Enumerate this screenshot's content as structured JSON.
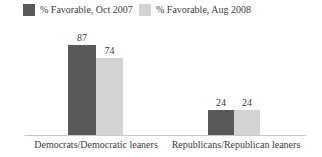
{
  "chart_data": {
    "type": "bar",
    "title": "",
    "categories": [
      "Democrats/Democratic leaners",
      "Republicans/Republican leaners"
    ],
    "series": [
      {
        "name": "% Favorable, Oct 2007",
        "color": "#58595b",
        "values": [
          87,
          24
        ]
      },
      {
        "name": "% Favorable, Aug 2008",
        "color": "#d1d3d4",
        "values": [
          74,
          24
        ]
      }
    ],
    "ylim": [
      0,
      100
    ],
    "value_labels_shown": true,
    "legend_position": "top",
    "grid": false,
    "axis_line_color": "#c9c9c9",
    "text_color": "#3d3d3f",
    "background_color": "#ffffff"
  }
}
